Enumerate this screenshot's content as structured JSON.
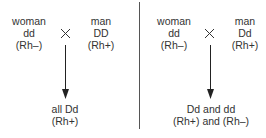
{
  "left": {
    "parent1": {
      "label": "woman",
      "genotype": "dd",
      "rh": "(Rh–)"
    },
    "parent2": {
      "label": "man",
      "genotype": "DD",
      "rh": "(Rh+)"
    },
    "cross_symbol": "×",
    "offspring": {
      "genotype": "all Dd",
      "rh": "(Rh+)"
    }
  },
  "right": {
    "parent1": {
      "label": "woman",
      "genotype": "dd",
      "rh": "(Rh–)"
    },
    "parent2": {
      "label": "man",
      "genotype": "Dd",
      "rh": "(Rh+)"
    },
    "cross_symbol": "×",
    "offspring": {
      "genotype": "Dd and dd",
      "rh": "(Rh+) and (Rh–)"
    }
  }
}
